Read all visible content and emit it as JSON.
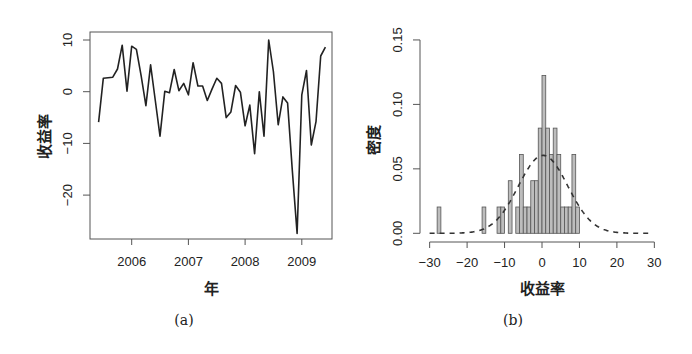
{
  "figure": {
    "panels": [
      {
        "caption": "(a)"
      },
      {
        "caption": "(b)"
      }
    ]
  },
  "chart_data": [
    {
      "type": "line",
      "caption": "(a)",
      "title": "",
      "xlabel": "年",
      "ylabel": "收益率",
      "xticks": [
        2006,
        2007,
        2008,
        2009
      ],
      "xtick_labels": [
        "2006",
        "2007",
        "2008",
        "2009"
      ],
      "yticks": [
        10,
        0,
        -10,
        -20
      ],
      "ytick_labels": [
        "10",
        "0",
        "−10",
        "−20"
      ],
      "xlim": [
        2005.33,
        2009.54
      ],
      "ylim": [
        -29.5,
        11.5
      ],
      "grid": false,
      "legend": null,
      "series": [
        {
          "name": "收益率",
          "style": "solid",
          "color": "#222222",
          "x_start": "2005-06",
          "frequency": "monthly",
          "x": [
            2005.417,
            2005.5,
            2005.583,
            2005.667,
            2005.75,
            2005.833,
            2005.917,
            2006.0,
            2006.083,
            2006.167,
            2006.25,
            2006.333,
            2006.417,
            2006.5,
            2006.583,
            2006.667,
            2006.75,
            2006.833,
            2006.917,
            2007.0,
            2007.083,
            2007.167,
            2007.25,
            2007.333,
            2007.417,
            2007.5,
            2007.583,
            2007.667,
            2007.75,
            2007.833,
            2007.917,
            2008.0,
            2008.083,
            2008.167,
            2008.25,
            2008.333,
            2008.417,
            2008.5,
            2008.583,
            2008.667,
            2008.75,
            2008.833,
            2008.917,
            2009.0,
            2009.083,
            2009.167,
            2009.25,
            2009.333,
            2009.417
          ],
          "values": [
            -5.9,
            2.6,
            2.7,
            2.8,
            4.4,
            9.0,
            0.1,
            8.8,
            8.2,
            3.0,
            -2.7,
            5.2,
            -1.7,
            -8.6,
            0.1,
            -0.2,
            4.3,
            0.2,
            1.6,
            -0.6,
            5.6,
            1.1,
            1.1,
            -1.7,
            0.5,
            2.6,
            1.6,
            -5.0,
            -3.9,
            1.2,
            -0.1,
            -6.6,
            -2.6,
            -12.0,
            0.0,
            -8.6,
            10.0,
            3.9,
            -6.4,
            -1.0,
            -2.2,
            -15.2,
            -27.4,
            -0.6,
            4.1,
            -10.3,
            -5.8,
            6.9,
            8.6
          ]
        }
      ]
    },
    {
      "type": "bar",
      "subtype": "histogram",
      "caption": "(b)",
      "title": "",
      "xlabel": "收益率",
      "ylabel": "密度",
      "xticks": [
        -30,
        -20,
        -10,
        0,
        10,
        20,
        30
      ],
      "xtick_labels": [
        "−30",
        "−20",
        "−10",
        "0",
        "10",
        "20",
        "30"
      ],
      "yticks": [
        0.0,
        0.05,
        0.1,
        0.15
      ],
      "ytick_labels": [
        "0.00",
        "0.05",
        "0.10",
        "0.15"
      ],
      "xlim": [
        -30,
        30
      ],
      "ylim": [
        0,
        0.15
      ],
      "grid": false,
      "legend": null,
      "bin_width": 1,
      "bins": [
        {
          "left": -28,
          "right": -27,
          "density": 0.0204
        },
        {
          "left": -16,
          "right": -15,
          "density": 0.0204
        },
        {
          "left": -12,
          "right": -11,
          "density": 0.0204
        },
        {
          "left": -11,
          "right": -10,
          "density": 0.0204
        },
        {
          "left": -9,
          "right": -8,
          "density": 0.0408
        },
        {
          "left": -7,
          "right": -6,
          "density": 0.0204
        },
        {
          "left": -6,
          "right": -5,
          "density": 0.0612
        },
        {
          "left": -5,
          "right": -4,
          "density": 0.0204
        },
        {
          "left": -4,
          "right": -3,
          "density": 0.0204
        },
        {
          "left": -3,
          "right": -2,
          "density": 0.0408
        },
        {
          "left": -2,
          "right": -1,
          "density": 0.0408
        },
        {
          "left": -1,
          "right": 0,
          "density": 0.0816
        },
        {
          "left": 0,
          "right": 1,
          "density": 0.1224
        },
        {
          "left": 1,
          "right": 2,
          "density": 0.0816
        },
        {
          "left": 2,
          "right": 3,
          "density": 0.0612
        },
        {
          "left": 3,
          "right": 4,
          "density": 0.0816
        },
        {
          "left": 4,
          "right": 5,
          "density": 0.0612
        },
        {
          "left": 5,
          "right": 6,
          "density": 0.0204
        },
        {
          "left": 6,
          "right": 7,
          "density": 0.0204
        },
        {
          "left": 7,
          "right": 8,
          "density": 0.0204
        },
        {
          "left": 8,
          "right": 9,
          "density": 0.0612
        },
        {
          "left": 9,
          "right": 10,
          "density": 0.0204
        }
      ],
      "bar_fill": "#bdbdbd",
      "bar_edge": "#555555",
      "overlay": {
        "type": "normal-density-curve",
        "style": "dashed",
        "mean": 0.3,
        "sd": 6.6,
        "peak_density": 0.06,
        "x_range": [
          -30,
          28.5
        ],
        "color": "#333333"
      }
    }
  ]
}
